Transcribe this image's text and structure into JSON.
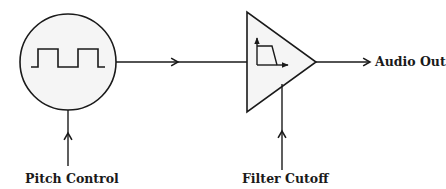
{
  "diagram": {
    "nodes": [
      {
        "id": "oscillator",
        "shape": "circle",
        "icon": "square-wave-icon"
      },
      {
        "id": "filter",
        "shape": "triangle",
        "icon": "lowpass-filter-icon"
      }
    ],
    "edges": [
      {
        "from": "oscillator",
        "to": "filter"
      },
      {
        "from": "filter",
        "to": "audio_out"
      },
      {
        "from": "pitch_control",
        "to": "oscillator"
      },
      {
        "from": "filter_cutoff",
        "to": "filter"
      }
    ],
    "labels": {
      "audio_out": "Audio Out",
      "pitch_control": "Pitch Control",
      "filter_cutoff": "Filter Cutoff"
    },
    "colors": {
      "stroke": "#1a1a1a",
      "fill": "#f5f5f5",
      "background": "#ffffff"
    }
  }
}
